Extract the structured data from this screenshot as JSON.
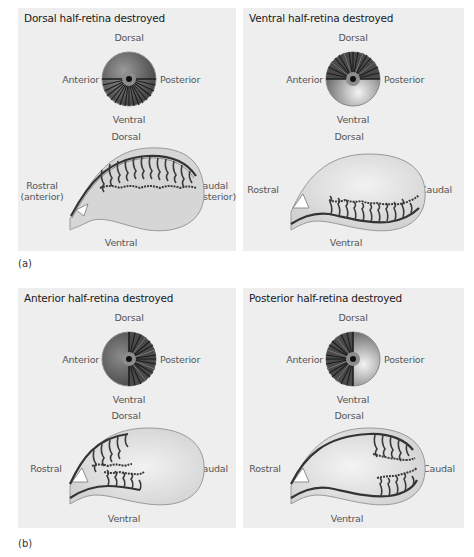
{
  "figure": {
    "parts": [
      {
        "label": "(a)",
        "panels": [
          {
            "title": "Dorsal half-retina destroyed",
            "eye": {
              "top": "Dorsal",
              "left": "Anterior",
              "right": "Posterior",
              "bottom": "Ventral",
              "intact_half": "ventral"
            },
            "tectum": {
              "top": "Dorsal",
              "left": "Rostral\n(anterior)",
              "left_line1": "Rostral",
              "left_line2": "(anterior)",
              "right_line1": "Caudal",
              "right_line2": "(posterior)",
              "bottom": "Ventral",
              "innervated_region": "entire tectum (dorsal route)"
            }
          },
          {
            "title": "Ventral half-retina destroyed",
            "eye": {
              "top": "Dorsal",
              "left": "Anterior",
              "right": "Posterior",
              "bottom": "Ventral",
              "intact_half": "dorsal"
            },
            "tectum": {
              "top": "Dorsal",
              "left_line1": "Rostral",
              "right_line1": "Caudal",
              "bottom": "Ventral",
              "innervated_region": "entire tectum (ventral route)"
            }
          }
        ]
      },
      {
        "label": "(b)",
        "panels": [
          {
            "title": "Anterior half-retina destroyed",
            "eye": {
              "top": "Dorsal",
              "left": "Anterior",
              "right": "Posterior",
              "bottom": "Ventral",
              "intact_half": "posterior"
            },
            "tectum": {
              "top": "Dorsal",
              "left_line1": "Rostral",
              "right_line1": "Caudal",
              "bottom": "Ventral",
              "innervated_region": "rostral half"
            }
          },
          {
            "title": "Posterior half-retina destroyed",
            "eye": {
              "top": "Dorsal",
              "left": "Anterior",
              "right": "Posterior",
              "bottom": "Ventral",
              "intact_half": "anterior"
            },
            "tectum": {
              "top": "Dorsal",
              "left_line1": "Rostral",
              "right_line1": "Caudal",
              "bottom": "Ventral",
              "innervated_region": "caudal half"
            }
          }
        ]
      }
    ],
    "colors": {
      "panel_bg": "#eeeeee",
      "tectum_fill": "#d9d9d9",
      "tectum_rim": "#b8b8b8",
      "eye_dark": "#4a4a4a",
      "eye_light": "#e0e0e0",
      "axon": "#3a3a3a"
    }
  }
}
